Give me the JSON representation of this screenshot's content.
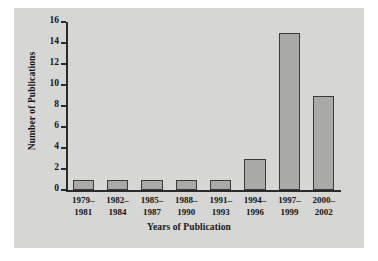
{
  "chart_data": {
    "type": "bar",
    "title": "",
    "xlabel": "Years of Publication",
    "ylabel": "Number of Publications",
    "categories": [
      "1979–\n1981",
      "1982–\n1984",
      "1985–\n1987",
      "1988–\n1990",
      "1991–\n1993",
      "1994–\n1996",
      "1997–\n1999",
      "2000–\n2002"
    ],
    "category_lines": [
      [
        "1979–",
        "1981"
      ],
      [
        "1982–",
        "1984"
      ],
      [
        "1985–",
        "1987"
      ],
      [
        "1988–",
        "1990"
      ],
      [
        "1991–",
        "1993"
      ],
      [
        "1994–",
        "1996"
      ],
      [
        "1997–",
        "1999"
      ],
      [
        "2000–",
        "2002"
      ]
    ],
    "values": [
      1,
      1,
      1,
      1,
      1,
      3,
      15,
      9
    ],
    "ylim": [
      0,
      16
    ],
    "yticks": [
      0,
      2,
      4,
      6,
      8,
      10,
      12,
      14,
      16
    ],
    "ytick_labels": [
      "0",
      "2",
      "4",
      "6",
      "8",
      "10",
      "12",
      "14",
      "16"
    ],
    "grid": false,
    "legend": null,
    "bar_color": "#a9a9a7",
    "bar_edge_color": "#3a3a3a",
    "panel_color": "#d6d6d4",
    "axis_color": "#2b2b2b"
  }
}
